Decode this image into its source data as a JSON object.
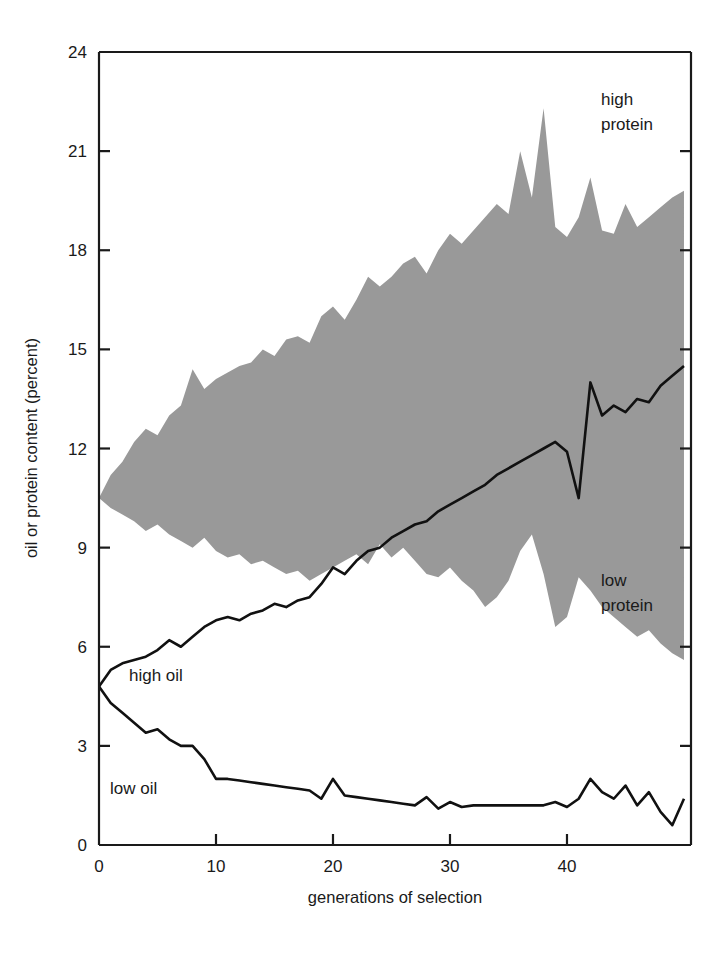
{
  "figure": {
    "background": "#ffffff",
    "axis_color": "#1a1a1a",
    "band_color": "#999999",
    "line_color": "#111111"
  },
  "labels": {
    "y_axis_title": "oil or protein content (percent)",
    "x_axis_title": "generations of selection",
    "high_protein_line1": "high",
    "high_protein_line2": "protein",
    "low_protein_line1": "low",
    "low_protein_line2": "protein",
    "high_oil": "high oil",
    "low_oil": "low oil"
  },
  "chart_data": {
    "type": "area",
    "title": "",
    "subtitle": "",
    "xlabel": "generations of selection",
    "ylabel": "oil or protein content (percent)",
    "xlim": [
      0,
      50.6
    ],
    "ylim": [
      0,
      24
    ],
    "xticks": [
      0,
      10,
      20,
      30,
      40
    ],
    "xtick_labels": [
      "0",
      "10",
      "20",
      "30",
      "40"
    ],
    "yticks": [
      0,
      3,
      6,
      9,
      12,
      15,
      18,
      21,
      24
    ],
    "ytick_labels": [
      "0",
      "3",
      "6",
      "9",
      "12",
      "15",
      "18",
      "21",
      "24"
    ],
    "grid": false,
    "legend": "inline-annotations",
    "annotations": [
      {
        "text": "high protein",
        "x": 44.5,
        "y": 22.6
      },
      {
        "text": "low protein",
        "x": 44.5,
        "y": 8.3
      },
      {
        "text": "high oil",
        "x": 4.0,
        "y": 4.6
      },
      {
        "text": "low oil",
        "x": 2.8,
        "y": 1.9
      }
    ],
    "x": [
      0,
      1,
      2,
      3,
      4,
      5,
      6,
      7,
      8,
      9,
      10,
      11,
      12,
      13,
      14,
      15,
      16,
      17,
      18,
      19,
      20,
      21,
      22,
      23,
      24,
      25,
      26,
      27,
      28,
      29,
      30,
      31,
      32,
      33,
      34,
      35,
      36,
      37,
      38,
      39,
      40,
      41,
      42,
      43,
      44,
      45,
      46,
      47,
      48,
      49,
      50
    ],
    "series": [
      {
        "name": "high protein",
        "type": "band-upper",
        "fill": "#999999",
        "values": [
          10.5,
          11.2,
          11.6,
          12.2,
          12.6,
          12.4,
          13.0,
          13.3,
          14.4,
          13.8,
          14.1,
          14.3,
          14.5,
          14.6,
          15.0,
          14.8,
          15.3,
          15.4,
          15.2,
          16.0,
          16.3,
          15.9,
          16.5,
          17.2,
          16.9,
          17.2,
          17.6,
          17.8,
          17.3,
          18.0,
          18.5,
          18.2,
          18.6,
          19.0,
          19.4,
          19.1,
          21.0,
          19.6,
          22.3,
          18.7,
          18.4,
          19.0,
          20.2,
          18.6,
          18.5,
          19.4,
          18.7,
          19.0,
          19.3,
          19.6,
          19.8
        ]
      },
      {
        "name": "low protein",
        "type": "band-lower",
        "fill": "#999999",
        "values": [
          10.5,
          10.2,
          10.0,
          9.8,
          9.5,
          9.7,
          9.4,
          9.2,
          9.0,
          9.3,
          8.9,
          8.7,
          8.8,
          8.5,
          8.6,
          8.4,
          8.2,
          8.3,
          8.0,
          8.2,
          8.4,
          8.6,
          8.8,
          8.5,
          9.1,
          8.7,
          9.0,
          8.6,
          8.2,
          8.1,
          8.4,
          8.0,
          7.7,
          7.2,
          7.5,
          8.0,
          8.9,
          9.4,
          8.2,
          6.6,
          6.9,
          8.1,
          7.7,
          7.2,
          6.9,
          6.6,
          6.3,
          6.5,
          6.1,
          5.8,
          5.6
        ]
      },
      {
        "name": "high oil",
        "type": "line",
        "color": "#111111",
        "values": [
          4.8,
          5.3,
          5.5,
          5.6,
          5.7,
          5.9,
          6.2,
          6.0,
          6.3,
          6.6,
          6.8,
          6.9,
          6.8,
          7.0,
          7.1,
          7.3,
          7.2,
          7.4,
          7.5,
          7.9,
          8.4,
          8.2,
          8.6,
          8.9,
          9.0,
          9.3,
          9.5,
          9.7,
          9.8,
          10.1,
          10.3,
          10.5,
          10.7,
          10.9,
          11.2,
          11.4,
          11.6,
          11.8,
          12.0,
          12.2,
          11.9,
          10.5,
          14.0,
          13.0,
          13.3,
          13.1,
          13.5,
          13.4,
          13.9,
          14.2,
          14.5
        ]
      },
      {
        "name": "low oil",
        "type": "line",
        "color": "#111111",
        "values": [
          4.8,
          4.3,
          4.0,
          3.7,
          3.4,
          3.5,
          3.2,
          3.0,
          3.0,
          2.6,
          2.0,
          2.0,
          1.95,
          1.9,
          1.85,
          1.8,
          1.75,
          1.7,
          1.65,
          1.4,
          2.0,
          1.5,
          1.45,
          1.4,
          1.35,
          1.3,
          1.25,
          1.2,
          1.45,
          1.1,
          1.3,
          1.15,
          1.2,
          1.2,
          1.2,
          1.2,
          1.2,
          1.2,
          1.2,
          1.3,
          1.15,
          1.4,
          2.0,
          1.6,
          1.4,
          1.8,
          1.2,
          1.6,
          1.0,
          0.6,
          1.4
        ]
      }
    ]
  }
}
